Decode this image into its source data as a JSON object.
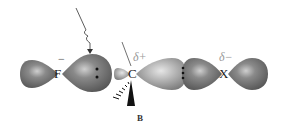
{
  "figure": {
    "label": "B",
    "top_text_fragment": "",
    "atoms": [
      {
        "symbol": "F",
        "charge": "−"
      },
      {
        "symbol": "C",
        "charge": "δ+"
      },
      {
        "symbol": "X",
        "charge": "δ−"
      }
    ],
    "colors": {
      "lobe_dark": "#6e6e6e",
      "lobe_light": "#a8a8a8",
      "lobe_highlight": "#d8d8d8",
      "lone_pair_dots": "#111111",
      "arrow": "#333333",
      "charge_text": "#999999"
    }
  }
}
